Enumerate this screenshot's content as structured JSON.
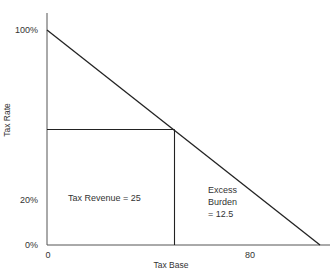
{
  "chart_data": {
    "type": "line",
    "title": "",
    "xlabel": "Tax Base",
    "ylabel": "Tax Rate",
    "grid": false,
    "legend": "none",
    "x_ticks": [
      {
        "value": 0,
        "label": "0"
      },
      {
        "value": 80,
        "label": "80"
      }
    ],
    "y_ticks": [
      {
        "value": 0,
        "label": "0%"
      },
      {
        "value": 20,
        "label": "20%"
      },
      {
        "value": 100,
        "label": "100%"
      }
    ],
    "series": [
      {
        "name": "demand-curve",
        "points": [
          {
            "x": 0,
            "y": 100
          },
          {
            "x": 100,
            "y": 0
          }
        ]
      }
    ],
    "reference_lines": {
      "tax_rate_level": 50,
      "tax_base_level": 50
    },
    "annotations": [
      {
        "id": "tax-revenue",
        "lines": [
          "Tax Revenue = 25"
        ]
      },
      {
        "id": "excess-burden",
        "lines": [
          "Excess",
          "Burden",
          "= 12.5"
        ]
      }
    ]
  }
}
